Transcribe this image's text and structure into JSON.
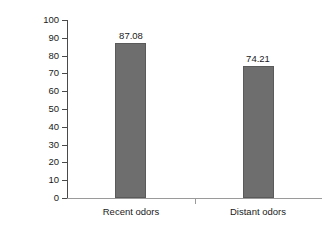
{
  "chart_data": {
    "type": "bar",
    "title": "",
    "xlabel": "",
    "ylabel": "Percentage of matches correct",
    "categories": [
      "Recent odors",
      "Distant odors"
    ],
    "values": [
      87.08,
      74.21
    ],
    "value_labels": [
      "87.08",
      "74.21"
    ],
    "ylim": [
      0,
      100
    ],
    "yticks": [
      0,
      10,
      20,
      30,
      40,
      50,
      60,
      70,
      80,
      90,
      100
    ],
    "ytick_labels": [
      "0",
      "10",
      "20",
      "30",
      "40",
      "50",
      "60",
      "70",
      "80",
      "90",
      "100"
    ],
    "grid": false,
    "legend": null,
    "bar_color": "#6e6e6e",
    "axis_color": "#4a4a4a",
    "background_color": "#ffffff"
  }
}
